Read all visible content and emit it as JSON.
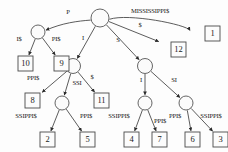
{
  "diagram": {
    "root_label": "root",
    "colors": {
      "stroke": "#4a4a4a",
      "node_fill": "#fbfbfb",
      "box_fill": "#fcfcfc",
      "text": "#1a1a1a",
      "background": "#fdfdfd"
    },
    "nodes": [
      {
        "id": "root",
        "type": "internal",
        "x": 100,
        "y": 18,
        "r": 9
      },
      {
        "id": "n_P",
        "type": "internal",
        "x": 38,
        "y": 32,
        "r": 7
      },
      {
        "id": "n_I",
        "type": "internal",
        "x": 73,
        "y": 66,
        "r": 7.5
      },
      {
        "id": "n_S",
        "type": "internal",
        "x": 145,
        "y": 66,
        "r": 7.5
      },
      {
        "id": "n_SSI",
        "type": "internal",
        "x": 62,
        "y": 103,
        "r": 7
      },
      {
        "id": "n_SI_I",
        "type": "internal",
        "x": 145,
        "y": 103,
        "r": 7
      },
      {
        "id": "n_SI_SI",
        "type": "internal",
        "x": 186,
        "y": 103,
        "r": 7
      }
    ],
    "leaves": [
      {
        "id": "leaf1",
        "label": "1",
        "x": 205,
        "y": 26
      },
      {
        "id": "leaf12",
        "label": "12",
        "x": 171,
        "y": 42
      },
      {
        "id": "leaf10",
        "label": "10",
        "x": 18,
        "y": 56
      },
      {
        "id": "leaf9",
        "label": "9",
        "x": 54,
        "y": 56
      },
      {
        "id": "leaf8",
        "label": "8",
        "x": 25,
        "y": 93
      },
      {
        "id": "leaf11",
        "label": "11",
        "x": 94,
        "y": 93
      },
      {
        "id": "leaf2",
        "label": "2",
        "x": 40,
        "y": 132
      },
      {
        "id": "leaf5",
        "label": "5",
        "x": 80,
        "y": 132
      },
      {
        "id": "leaf4",
        "label": "4",
        "x": 124,
        "y": 132
      },
      {
        "id": "leaf7",
        "label": "7",
        "x": 152,
        "y": 132
      },
      {
        "id": "leaf6",
        "label": "6",
        "x": 185,
        "y": 132
      },
      {
        "id": "leaf3",
        "label": "3",
        "x": 213,
        "y": 132
      }
    ],
    "edges": [
      {
        "id": "e_root_P",
        "from": "root",
        "to": "n_P",
        "label": "P",
        "label_x": 68,
        "label_y": 14
      },
      {
        "id": "e_root_miss",
        "from": "root",
        "to": "leaf1",
        "label": "MISSISSIPPI$",
        "label_x": 150,
        "label_y": 13
      },
      {
        "id": "e_root_dol",
        "from": "root",
        "to": "leaf12",
        "label": "$",
        "label_x": 140,
        "label_y": 27
      },
      {
        "id": "e_root_I",
        "from": "root",
        "to": "n_I",
        "label": "I",
        "label_x": 83,
        "label_y": 40
      },
      {
        "id": "e_root_S",
        "from": "root",
        "to": "n_S",
        "label": "S",
        "label_x": 118,
        "label_y": 42
      },
      {
        "id": "e_P_Idol",
        "from": "n_P",
        "to": "leaf10",
        "label": "I$",
        "label_x": 19,
        "label_y": 41
      },
      {
        "id": "e_P_PIdol",
        "from": "n_P",
        "to": "leaf9",
        "label": "PI$",
        "label_x": 56,
        "label_y": 41
      },
      {
        "id": "e_I_PPI",
        "from": "n_I",
        "to": "leaf8",
        "label": "PPI$",
        "label_x": 33,
        "label_y": 80
      },
      {
        "id": "e_I_SSI",
        "from": "n_I",
        "to": "n_SSI",
        "label": "SSI",
        "label_x": 77,
        "label_y": 85
      },
      {
        "id": "e_I_dol",
        "from": "n_I",
        "to": "leaf11",
        "label": "$",
        "label_x": 92,
        "label_y": 79
      },
      {
        "id": "e_SSI_SSIPPI",
        "from": "n_SSI",
        "to": "leaf2",
        "label": "SSIPPI$",
        "label_x": 26,
        "label_y": 118
      },
      {
        "id": "e_SSI_PPI",
        "from": "n_SSI",
        "to": "leaf5",
        "label": "PPI$",
        "label_x": 86,
        "label_y": 118
      },
      {
        "id": "e_S_I",
        "from": "n_S",
        "to": "n_SI_I",
        "label": "I",
        "label_x": 141,
        "label_y": 82
      },
      {
        "id": "e_S_SI",
        "from": "n_S",
        "to": "n_SI_SI",
        "label": "SI",
        "label_x": 174,
        "label_y": 82
      },
      {
        "id": "e_SII_SSIPPI",
        "from": "n_SI_I",
        "to": "leaf4",
        "label": "SSIPPI$",
        "label_x": 119,
        "label_y": 118
      },
      {
        "id": "e_SII_PPI",
        "from": "n_SI_I",
        "to": "leaf7",
        "label": "PPI$",
        "label_x": 160,
        "label_y": 123
      },
      {
        "id": "e_SISI_PPI",
        "from": "n_SI_SI",
        "to": "leaf6",
        "label": "PPI$",
        "label_x": 175,
        "label_y": 118
      },
      {
        "id": "e_SISI_SSI",
        "from": "n_SI_SI",
        "to": "leaf3",
        "label": "SSIPPI$",
        "label_x": 211,
        "label_y": 118
      }
    ]
  }
}
